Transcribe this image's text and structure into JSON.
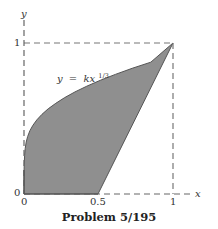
{
  "figure": {
    "caption": "Problem 5/195",
    "equation_label": {
      "lhs": "y",
      "eq": "=",
      "rhs": "kx",
      "exponent": "1/3"
    },
    "axes": {
      "x_label": "x",
      "y_label": "y",
      "x_ticks": [
        "0",
        "0.5",
        "1"
      ],
      "y_ticks": [
        "0",
        "1"
      ]
    },
    "colors": {
      "region_fill": "#8f8f8f",
      "axis": "#555555",
      "dashed": "#777777",
      "text": "#333333"
    },
    "region": {
      "description": "Shaded region between curve y = k x^(1/3) and straight line from (0.5,0) to (1,1)",
      "curve": "y = x^(1/3)",
      "line_from": [
        0.5,
        0
      ],
      "line_to": [
        1,
        1
      ]
    }
  }
}
